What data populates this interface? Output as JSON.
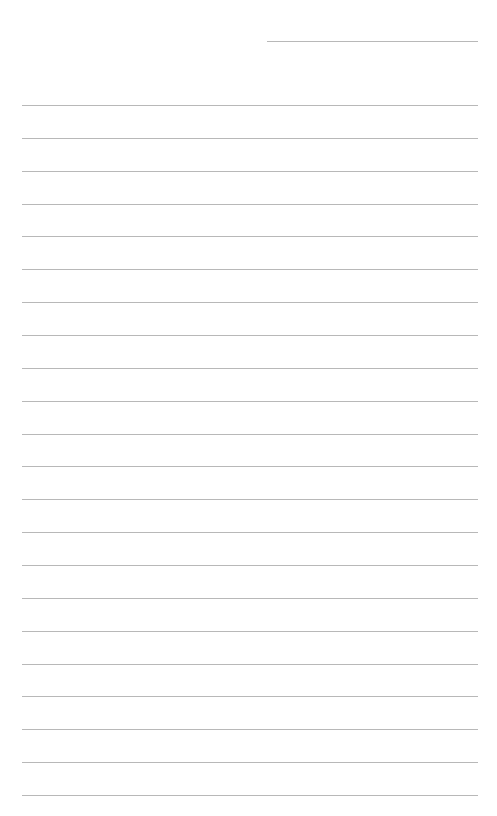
{
  "page": {
    "type": "lined-paper",
    "background_color": "#ffffff",
    "line_color": "#b8b8b8",
    "header_line": {
      "label": "date-line"
    },
    "ruled_line_count": 22,
    "ruled_lines_text": [
      "",
      "",
      "",
      "",
      "",
      "",
      "",
      "",
      "",
      "",
      "",
      "",
      "",
      "",
      "",
      "",
      "",
      "",
      "",
      "",
      "",
      ""
    ]
  }
}
